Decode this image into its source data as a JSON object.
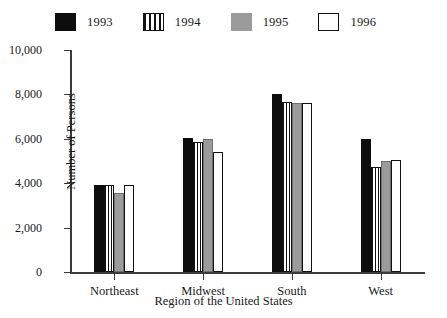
{
  "chart_data": {
    "type": "bar",
    "title": "",
    "xlabel": "Region of the United States",
    "ylabel": "Number of Persons",
    "categories": [
      "Northeast",
      "Midwest",
      "South",
      "West"
    ],
    "series": [
      {
        "name": "1993",
        "swatch": "solid-black",
        "color": "#0d0d0d",
        "values": [
          3900,
          6050,
          8000,
          6000
        ]
      },
      {
        "name": "1994",
        "swatch": "vertical-lines",
        "color": "#ffffff",
        "values": [
          3900,
          5850,
          7650,
          4750
        ]
      },
      {
        "name": "1995",
        "swatch": "solid-gray",
        "color": "#9b9b9b",
        "values": [
          3550,
          6000,
          7600,
          5000
        ]
      },
      {
        "name": "1996",
        "swatch": "solid-white",
        "color": "#ffffff",
        "values": [
          3900,
          5400,
          7600,
          5050
        ]
      }
    ],
    "ylim": [
      0,
      10000
    ],
    "ytick_values": [
      0,
      2000,
      4000,
      6000,
      8000,
      10000
    ],
    "ytick_labels": [
      "0",
      "2,000",
      "4,000",
      "6,000",
      "8,000",
      "10,000"
    ],
    "grid": false,
    "legend_position": "top"
  },
  "legend": {
    "items": [
      {
        "label": "1993"
      },
      {
        "label": "1994"
      },
      {
        "label": "1995"
      },
      {
        "label": "1996"
      }
    ]
  },
  "axes": {
    "y_title": "Number of Persons",
    "x_title": "Region of the United States"
  }
}
